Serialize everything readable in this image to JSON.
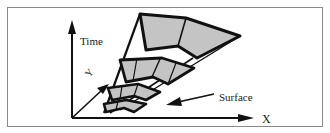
{
  "diagram": {
    "labels": {
      "time": "Time",
      "y": "Y",
      "x": "X",
      "surface": "Surface"
    },
    "colors": {
      "stroke": "#111111",
      "fill": "#c4c4c4",
      "border": "#8a8a8a",
      "background": "#ffffff"
    }
  }
}
